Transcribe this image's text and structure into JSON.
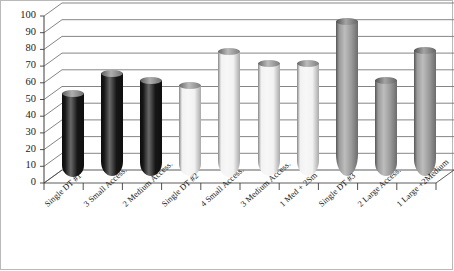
{
  "chart_data": {
    "type": "bar",
    "title": "",
    "subtitle": "",
    "xlabel": "",
    "ylabel": "",
    "ylim": [
      0,
      100
    ],
    "yticks": [
      100,
      90,
      80,
      70,
      60,
      50,
      40,
      30,
      20,
      10,
      0
    ],
    "grid": true,
    "legend": "none",
    "style": "3d-cylinder",
    "categories": [
      "Single DT #1",
      "3 Small Access.",
      "2 Medium Access.",
      "Single DT #2",
      "4 Small Access.",
      "3 Medium Access.",
      "1 Med + 2Sm",
      "Single DT #3",
      "2 Large Access.",
      "1 Large +2Medium"
    ],
    "values": [
      50,
      62,
      58,
      55,
      75,
      68,
      68,
      93,
      58,
      76
    ],
    "bar_colors": [
      "#161616",
      "#161616",
      "#161616",
      "#f2f2f2",
      "#f2f2f2",
      "#f2f2f2",
      "#f2f2f2",
      "#9a9a9a",
      "#9a9a9a",
      "#9a9a9a"
    ],
    "cap_colors": [
      "#8c8c8c",
      "#8c8c8c",
      "#8c8c8c",
      "#9e9e9e",
      "#9e9e9e",
      "#9e9e9e",
      "#9e9e9e",
      "#7d7d7d",
      "#7d7d7d",
      "#7d7d7d"
    ],
    "colors": {
      "axis": "#4a4a4a",
      "grid": "#6f6f6f",
      "plot_background": "#ffffff",
      "text": "#161616",
      "frame": "#b9b9b9"
    }
  }
}
